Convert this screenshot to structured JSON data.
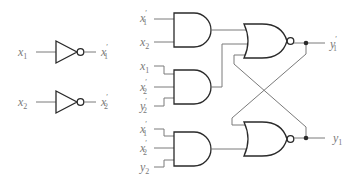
{
  "diagram": {
    "title": "",
    "type": "logic-circuit",
    "inverters": [
      {
        "input": "x",
        "input_sub": "1",
        "output": "x",
        "output_sub": "1",
        "output_prime": "′"
      },
      {
        "input": "x",
        "input_sub": "2",
        "output": "x",
        "output_sub": "2",
        "output_prime": "′"
      }
    ],
    "and_gates": [
      {
        "inputs": [
          {
            "var": "x",
            "sub": "1",
            "prime": "′"
          },
          {
            "var": "x",
            "sub": "2",
            "prime": ""
          }
        ]
      },
      {
        "inputs": [
          {
            "var": "x",
            "sub": "1",
            "prime": ""
          },
          {
            "var": "x",
            "sub": "2",
            "prime": "′"
          },
          {
            "var": "y",
            "sub": "2",
            "prime": "′"
          }
        ]
      },
      {
        "inputs": [
          {
            "var": "x",
            "sub": "1",
            "prime": "′"
          },
          {
            "var": "x",
            "sub": "2",
            "prime": "′"
          },
          {
            "var": "y",
            "sub": "2",
            "prime": ""
          }
        ]
      }
    ],
    "nor_gates": [
      {
        "output": "y",
        "output_sub": "1",
        "output_prime": "′"
      },
      {
        "output": "y",
        "output_sub": "1",
        "output_prime": ""
      }
    ],
    "colors": {
      "gate_stroke": "#2a2a2a",
      "wire": "#7a7a7a",
      "label": "#7a7a7a"
    }
  }
}
